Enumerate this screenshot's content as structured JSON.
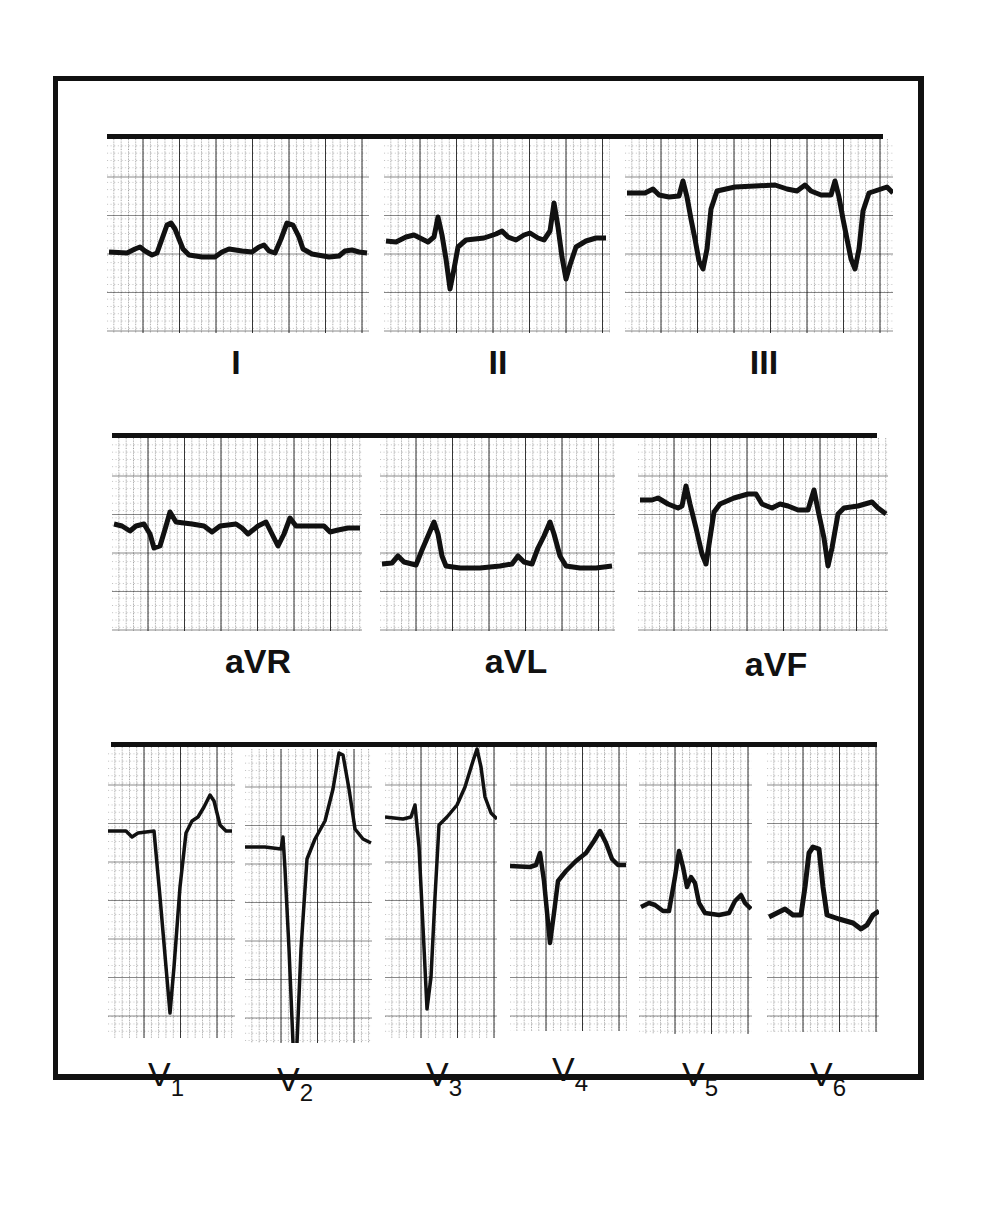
{
  "figure": {
    "rows": [
      {
        "id": "limb-leads",
        "leads": [
          {
            "name": "I",
            "label": "I"
          },
          {
            "name": "II",
            "label": "II"
          },
          {
            "name": "III",
            "label": "III"
          }
        ]
      },
      {
        "id": "augmented-leads",
        "leads": [
          {
            "name": "aVR",
            "label": "aVR"
          },
          {
            "name": "aVL",
            "label": "aVL"
          },
          {
            "name": "aVF",
            "label": "aVF"
          }
        ]
      },
      {
        "id": "precordial-leads",
        "leads": [
          {
            "name": "V1",
            "label_main": "V",
            "label_sub": "1"
          },
          {
            "name": "V2",
            "label_main": "V",
            "label_sub": "2"
          },
          {
            "name": "V3",
            "label_main": "V",
            "label_sub": "3"
          },
          {
            "name": "V4",
            "label_main": "V",
            "label_sub": "4"
          },
          {
            "name": "V5",
            "label_main": "V",
            "label_sub": "5"
          },
          {
            "name": "V6",
            "label_main": "V",
            "label_sub": "6"
          }
        ]
      }
    ],
    "colors": {
      "ink": "#111111",
      "grid": "#222222",
      "paper": "#ffffff"
    }
  }
}
